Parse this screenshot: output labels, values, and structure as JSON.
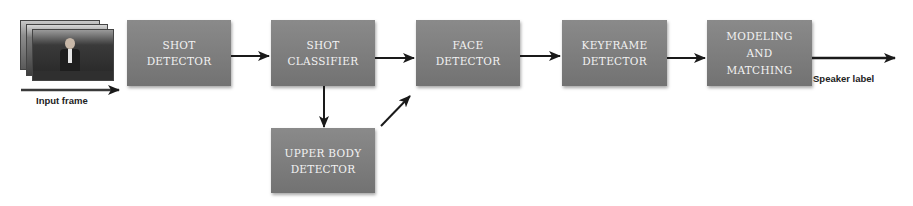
{
  "diagram": {
    "input": {
      "label": "Input frame",
      "icon": "video-frames-stack-image"
    },
    "nodes": [
      {
        "id": "shot_detector",
        "label": "SHOT\nDETECTOR"
      },
      {
        "id": "shot_classifier",
        "label": "SHOT\nCLASSIFIER"
      },
      {
        "id": "face_detector",
        "label": "FACE\nDETECTOR"
      },
      {
        "id": "keyframe_detector",
        "label": "KEYFRAME\nDETECTOR"
      },
      {
        "id": "modeling_matching",
        "label": "MODELING\nAND\nMATCHING"
      },
      {
        "id": "upper_body_detector",
        "label": "UPPER BODY\nDETECTOR"
      }
    ],
    "edges": [
      {
        "from": "input",
        "to": "shot_detector"
      },
      {
        "from": "shot_detector",
        "to": "shot_classifier"
      },
      {
        "from": "shot_classifier",
        "to": "face_detector"
      },
      {
        "from": "shot_classifier",
        "to": "upper_body_detector"
      },
      {
        "from": "upper_body_detector",
        "to": "face_detector"
      },
      {
        "from": "face_detector",
        "to": "keyframe_detector"
      },
      {
        "from": "keyframe_detector",
        "to": "modeling_matching"
      },
      {
        "from": "modeling_matching",
        "to": "output"
      }
    ],
    "output": {
      "label": "Speaker label"
    },
    "colors": {
      "box_fill": "#7d7d7d",
      "box_text": "#f2f2f2",
      "arrow": "#1a1a1a",
      "background": "#ffffff"
    }
  }
}
